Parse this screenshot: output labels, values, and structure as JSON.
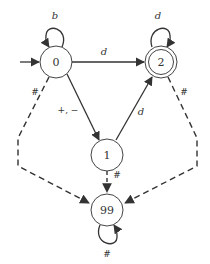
{
  "diagram": {
    "type": "finite-state-automaton",
    "colors": {
      "stroke": "#333333",
      "fill": "#ffffff",
      "text": "#333333"
    },
    "start_state": "0",
    "states": [
      {
        "id": "0",
        "label": "0",
        "accepting": false
      },
      {
        "id": "1",
        "label": "1",
        "accepting": false
      },
      {
        "id": "2",
        "label": "2",
        "accepting": true
      },
      {
        "id": "99",
        "label": "99",
        "accepting": false
      }
    ],
    "transitions": [
      {
        "from": "0",
        "to": "0",
        "label": "b",
        "style": "solid"
      },
      {
        "from": "0",
        "to": "2",
        "label": "d",
        "style": "solid"
      },
      {
        "from": "0",
        "to": "1",
        "label": "+, −",
        "style": "solid"
      },
      {
        "from": "1",
        "to": "2",
        "label": "d",
        "style": "solid"
      },
      {
        "from": "2",
        "to": "2",
        "label": "d",
        "style": "solid"
      },
      {
        "from": "0",
        "to": "99",
        "label": "#",
        "style": "dashed"
      },
      {
        "from": "2",
        "to": "99",
        "label": "#",
        "style": "dashed"
      },
      {
        "from": "1",
        "to": "99",
        "label": "#",
        "style": "dashed"
      },
      {
        "from": "99",
        "to": "99",
        "label": "#",
        "style": "solid"
      }
    ]
  }
}
